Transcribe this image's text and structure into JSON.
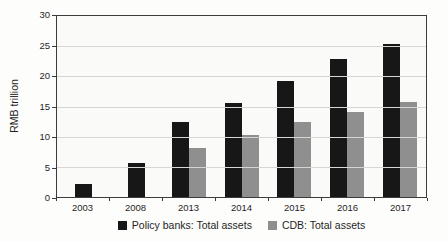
{
  "chart_data": {
    "type": "bar",
    "title": "",
    "xlabel": "",
    "ylabel": "RMB trillion",
    "ylim": [
      0,
      30
    ],
    "ytick_step": 5,
    "yticks": [
      0,
      5,
      10,
      15,
      20,
      25,
      30
    ],
    "grid": "horizontal",
    "legend_position": "bottom",
    "categories": [
      "2003",
      "2008",
      "2013",
      "2014",
      "2015",
      "2016",
      "2017"
    ],
    "series": [
      {
        "name": "Policy banks: Total assets",
        "key": "policy-banks",
        "color": "#171717",
        "values": [
          2.1,
          5.6,
          12.4,
          15.5,
          19.3,
          22.8,
          25.4
        ]
      },
      {
        "name": "CDB: Total assets",
        "key": "cdb",
        "color": "#8f8f8f",
        "values": [
          null,
          null,
          8.2,
          10.3,
          12.5,
          14.1,
          15.8
        ]
      }
    ]
  },
  "colors": {
    "page_bg": "#fdfdfc",
    "plot_bg": "#fafaf8",
    "grid": "#d6d6d4",
    "axis_border": "#3c3c3c",
    "text": "#1f1f1f"
  }
}
